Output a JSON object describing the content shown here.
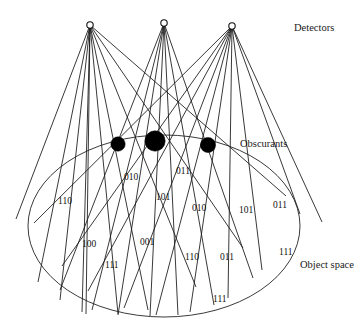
{
  "figure": {
    "type": "diagram",
    "width": 363,
    "height": 327,
    "background_color": "#ffffff",
    "line_color": "#151515",
    "obscurant_color": "#000000",
    "detector_fill_color": "#ffffff"
  },
  "labels": {
    "detectors": "Detectors",
    "obscurants": "Obscurants",
    "object_space": "Object space"
  },
  "label_positions": {
    "detectors": {
      "x": 294,
      "y": 31
    },
    "obscurants": {
      "x": 240,
      "y": 147
    },
    "object_space": {
      "x": 300,
      "y": 268
    }
  },
  "detectors": [
    {
      "name": "detector-left",
      "x": 90,
      "y": 25,
      "r": 3.2
    },
    {
      "name": "detector-middle",
      "x": 164,
      "y": 23,
      "r": 3.2
    },
    {
      "name": "detector-right",
      "x": 232,
      "y": 26,
      "r": 3.2
    }
  ],
  "obscurants": [
    {
      "name": "obscurant-left",
      "x": 118,
      "y": 144,
      "r": 7.2
    },
    {
      "name": "obscurant-middle",
      "x": 155,
      "y": 141,
      "r": 10.2
    },
    {
      "name": "obscurant-right",
      "x": 208,
      "y": 145,
      "r": 7.6
    }
  ],
  "object_space_ellipse": {
    "cx": 164,
    "cy": 226,
    "rx": 136,
    "ry": 91
  },
  "codes": [
    {
      "text": "110",
      "x": 58,
      "y": 204
    },
    {
      "text": "010",
      "x": 124,
      "y": 180
    },
    {
      "text": "011",
      "x": 176,
      "y": 174
    },
    {
      "text": "101",
      "x": 156,
      "y": 200
    },
    {
      "text": "010",
      "x": 192,
      "y": 211
    },
    {
      "text": "101",
      "x": 239,
      "y": 213
    },
    {
      "text": "011",
      "x": 273,
      "y": 208
    },
    {
      "text": "100",
      "x": 82,
      "y": 247
    },
    {
      "text": "001",
      "x": 140,
      "y": 245
    },
    {
      "text": "111",
      "x": 105,
      "y": 268
    },
    {
      "text": "110",
      "x": 185,
      "y": 260
    },
    {
      "text": "011",
      "x": 220,
      "y": 260
    },
    {
      "text": "111",
      "x": 279,
      "y": 255
    },
    {
      "text": "111",
      "x": 213,
      "y": 302
    }
  ],
  "rays": [
    {
      "from": 0,
      "x1": 90,
      "y1": 25,
      "x2": 16,
      "y2": 219
    },
    {
      "from": 0,
      "x1": 90,
      "y1": 25,
      "x2": 38,
      "y2": 282
    },
    {
      "from": 0,
      "x1": 90,
      "y1": 25,
      "x2": 60,
      "y2": 300
    },
    {
      "from": 0,
      "x1": 90,
      "y1": 25,
      "x2": 82,
      "y2": 312
    },
    {
      "from": 0,
      "x1": 90,
      "y1": 25,
      "x2": 86,
      "y2": 314
    },
    {
      "from": 0,
      "x1": 90,
      "y1": 25,
      "x2": 118,
      "y2": 314
    },
    {
      "from": 0,
      "x1": 90,
      "y1": 25,
      "x2": 148,
      "y2": 310
    },
    {
      "from": 0,
      "x1": 90,
      "y1": 25,
      "x2": 196,
      "y2": 287
    },
    {
      "from": 0,
      "x1": 90,
      "y1": 25,
      "x2": 243,
      "y2": 248
    },
    {
      "from": 0,
      "x1": 90,
      "y1": 25,
      "x2": 286,
      "y2": 196
    },
    {
      "from": 1,
      "x1": 164,
      "y1": 23,
      "x2": 60,
      "y2": 290
    },
    {
      "from": 1,
      "x1": 164,
      "y1": 23,
      "x2": 92,
      "y2": 310
    },
    {
      "from": 1,
      "x1": 164,
      "y1": 23,
      "x2": 118,
      "y2": 315
    },
    {
      "from": 1,
      "x1": 164,
      "y1": 23,
      "x2": 150,
      "y2": 316
    },
    {
      "from": 1,
      "x1": 164,
      "y1": 23,
      "x2": 178,
      "y2": 315
    },
    {
      "from": 1,
      "x1": 164,
      "y1": 23,
      "x2": 214,
      "y2": 305
    },
    {
      "from": 1,
      "x1": 164,
      "y1": 23,
      "x2": 253,
      "y2": 278
    },
    {
      "from": 2,
      "x1": 232,
      "y1": 26,
      "x2": 34,
      "y2": 223
    },
    {
      "from": 2,
      "x1": 232,
      "y1": 26,
      "x2": 62,
      "y2": 266
    },
    {
      "from": 2,
      "x1": 232,
      "y1": 26,
      "x2": 88,
      "y2": 291
    },
    {
      "from": 2,
      "x1": 232,
      "y1": 26,
      "x2": 124,
      "y2": 308
    },
    {
      "from": 2,
      "x1": 232,
      "y1": 26,
      "x2": 156,
      "y2": 315
    },
    {
      "from": 2,
      "x1": 232,
      "y1": 26,
      "x2": 190,
      "y2": 312
    },
    {
      "from": 2,
      "x1": 232,
      "y1": 26,
      "x2": 228,
      "y2": 298
    },
    {
      "from": 2,
      "x1": 232,
      "y1": 26,
      "x2": 262,
      "y2": 270
    },
    {
      "from": 2,
      "x1": 232,
      "y1": 26,
      "x2": 300,
      "y2": 214
    },
    {
      "from": 2,
      "x1": 232,
      "y1": 26,
      "x2": 322,
      "y2": 222
    }
  ]
}
